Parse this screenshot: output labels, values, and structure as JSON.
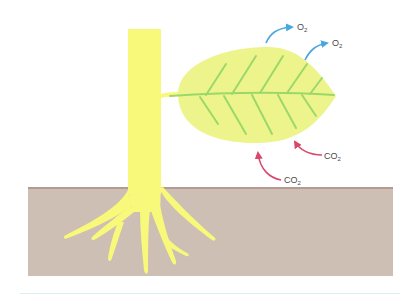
{
  "diagram": {
    "type": "photosynthesis-gas-exchange",
    "colors": {
      "plant": "#f8f87a",
      "leaf": "#eef48c",
      "veins": "#9bd86a",
      "soil": "#cdbfb4",
      "soil_line": "#b49a90",
      "o2_arrow": "#4aa6de",
      "co2_arrow": "#d9486a",
      "rule": "#d8f2f4"
    },
    "labels": {
      "o2_top": {
        "base": "O",
        "sub": "2"
      },
      "o2_right": {
        "base": "O",
        "sub": "2"
      },
      "co2_right": {
        "base": "CO",
        "sub": "2"
      },
      "co2_bottom": {
        "base": "CO",
        "sub": "2"
      }
    },
    "parts": [
      "stem",
      "leaf",
      "roots",
      "soil"
    ]
  }
}
